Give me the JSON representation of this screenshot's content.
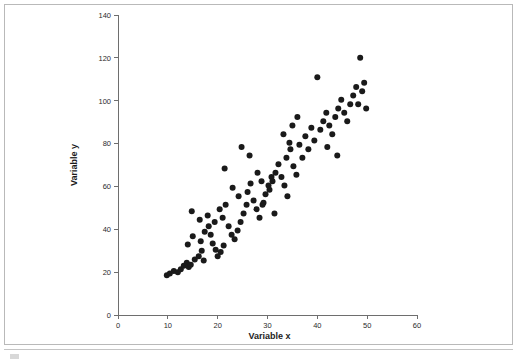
{
  "figure": {
    "background_color": "#ffffff",
    "frame_color": "#b9b9b9",
    "point_color": "#1a1a1a",
    "axis_color": "#6e6e6e"
  },
  "chart_data": {
    "type": "scatter",
    "title": "",
    "subtitle": "",
    "xlabel": "Variable x",
    "ylabel": "Variable y",
    "xlim": [
      0,
      60
    ],
    "ylim": [
      0,
      140
    ],
    "xticks": [
      0,
      10,
      20,
      30,
      40,
      50,
      60
    ],
    "yticks": [
      0,
      20,
      40,
      60,
      80,
      100,
      120,
      140
    ],
    "xtick_labels": [
      "0",
      "10",
      "20",
      "30",
      "40",
      "50",
      "60"
    ],
    "ytick_labels": [
      "0",
      "20",
      "40",
      "60",
      "80",
      "100",
      "120",
      "140"
    ],
    "grid": false,
    "legend": null,
    "annotations": [],
    "marker": {
      "shape": "circle",
      "size": 3,
      "color": "#1a1a1a"
    },
    "n_points": 98,
    "points": [
      [
        9.8,
        18.5
      ],
      [
        10.4,
        19.4
      ],
      [
        11.2,
        20.5
      ],
      [
        12.0,
        20.0
      ],
      [
        12.6,
        21.4
      ],
      [
        13.2,
        23.0
      ],
      [
        13.8,
        24.4
      ],
      [
        14.2,
        22.4
      ],
      [
        14.6,
        23.4
      ],
      [
        15.4,
        25.9
      ],
      [
        16.2,
        27.4
      ],
      [
        16.8,
        30.0
      ],
      [
        17.2,
        25.4
      ],
      [
        14.0,
        32.9
      ],
      [
        15.0,
        36.8
      ],
      [
        16.6,
        34.4
      ],
      [
        17.4,
        38.9
      ],
      [
        18.2,
        41.4
      ],
      [
        18.6,
        37.4
      ],
      [
        19.0,
        33.4
      ],
      [
        19.6,
        30.4
      ],
      [
        20.0,
        27.4
      ],
      [
        20.6,
        29.4
      ],
      [
        21.2,
        32.4
      ],
      [
        14.8,
        48.4
      ],
      [
        16.4,
        44.4
      ],
      [
        18.0,
        46.4
      ],
      [
        19.4,
        43.4
      ],
      [
        20.4,
        49.4
      ],
      [
        21.0,
        45.4
      ],
      [
        21.6,
        51.4
      ],
      [
        22.2,
        41.4
      ],
      [
        22.8,
        37.4
      ],
      [
        23.4,
        35.4
      ],
      [
        24.0,
        39.4
      ],
      [
        24.6,
        43.4
      ],
      [
        25.2,
        47.4
      ],
      [
        25.8,
        51.4
      ],
      [
        21.4,
        68.4
      ],
      [
        23.0,
        59.4
      ],
      [
        24.2,
        55.4
      ],
      [
        26.0,
        57.4
      ],
      [
        26.6,
        61.4
      ],
      [
        27.2,
        53.4
      ],
      [
        27.8,
        49.4
      ],
      [
        28.4,
        45.4
      ],
      [
        29.0,
        51.4
      ],
      [
        29.6,
        56.4
      ],
      [
        30.2,
        60.4
      ],
      [
        30.8,
        64.4
      ],
      [
        24.8,
        78.4
      ],
      [
        26.4,
        74.4
      ],
      [
        28.0,
        66.4
      ],
      [
        28.8,
        62.4
      ],
      [
        30.4,
        58.4
      ],
      [
        31.0,
        62.4
      ],
      [
        31.6,
        66.4
      ],
      [
        32.2,
        70.4
      ],
      [
        32.8,
        64.4
      ],
      [
        33.4,
        60.4
      ],
      [
        34.0,
        55.4
      ],
      [
        31.4,
        47.4
      ],
      [
        29.2,
        52.4
      ],
      [
        33.8,
        73.4
      ],
      [
        34.6,
        77.4
      ],
      [
        35.2,
        69.4
      ],
      [
        35.8,
        65.4
      ],
      [
        36.4,
        79.4
      ],
      [
        37.0,
        73.4
      ],
      [
        37.6,
        83.4
      ],
      [
        38.2,
        77.4
      ],
      [
        38.8,
        87.4
      ],
      [
        35.0,
        88.4
      ],
      [
        36.0,
        92.4
      ],
      [
        33.2,
        84.4
      ],
      [
        34.4,
        80.4
      ],
      [
        39.4,
        81.4
      ],
      [
        40.0,
        111.0
      ],
      [
        40.6,
        86.4
      ],
      [
        41.2,
        90.4
      ],
      [
        41.8,
        94.4
      ],
      [
        42.4,
        88.4
      ],
      [
        43.0,
        84.4
      ],
      [
        43.6,
        92.4
      ],
      [
        44.2,
        96.4
      ],
      [
        44.8,
        100.4
      ],
      [
        45.4,
        94.4
      ],
      [
        46.0,
        90.4
      ],
      [
        42.0,
        78.4
      ],
      [
        44.0,
        74.4
      ],
      [
        46.6,
        98.4
      ],
      [
        47.2,
        102.4
      ],
      [
        47.8,
        106.4
      ],
      [
        48.2,
        98.4
      ],
      [
        48.6,
        120.0
      ],
      [
        49.0,
        104.4
      ],
      [
        49.4,
        108.4
      ],
      [
        49.8,
        96.4
      ]
    ]
  }
}
